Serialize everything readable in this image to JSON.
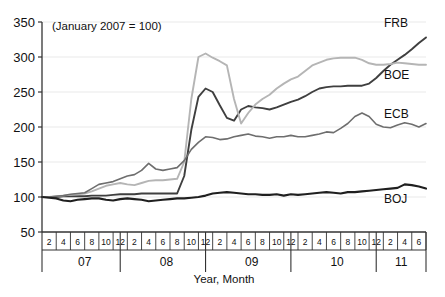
{
  "chart_data": {
    "type": "line",
    "title": "(January 2007 = 100)",
    "xlabel": "Year, Month",
    "ylabel": "",
    "ylim": [
      50,
      350
    ],
    "yticks": [
      50,
      100,
      150,
      200,
      250,
      300,
      350
    ],
    "grid": true,
    "legend_position": "right-inline-labels",
    "years": [
      "07",
      "08",
      "09",
      "10",
      "11"
    ],
    "month_ticks_per_year": {
      "07": [
        2,
        4,
        6,
        8,
        10,
        12
      ],
      "08": [
        2,
        4,
        6,
        8,
        10,
        12
      ],
      "09": [
        2,
        4,
        6,
        8,
        10,
        12
      ],
      "10": [
        2,
        4,
        6,
        8,
        10,
        12
      ],
      "11": [
        2,
        4,
        6
      ]
    },
    "x": [
      "2007-01",
      "2007-02",
      "2007-03",
      "2007-04",
      "2007-05",
      "2007-06",
      "2007-07",
      "2007-08",
      "2007-09",
      "2007-10",
      "2007-11",
      "2007-12",
      "2008-01",
      "2008-02",
      "2008-03",
      "2008-04",
      "2008-05",
      "2008-06",
      "2008-07",
      "2008-08",
      "2008-09",
      "2008-10",
      "2008-11",
      "2008-12",
      "2009-01",
      "2009-02",
      "2009-03",
      "2009-04",
      "2009-05",
      "2009-06",
      "2009-07",
      "2009-08",
      "2009-09",
      "2009-10",
      "2009-11",
      "2009-12",
      "2010-01",
      "2010-02",
      "2010-03",
      "2010-04",
      "2010-05",
      "2010-06",
      "2010-07",
      "2010-08",
      "2010-09",
      "2010-10",
      "2010-11",
      "2010-12",
      "2011-01",
      "2011-02",
      "2011-03",
      "2011-04",
      "2011-05",
      "2011-06",
      "2011-07"
    ],
    "series": [
      {
        "name": "FRB",
        "color": "#3f3f3f",
        "width": 1.9,
        "label_x": "2011-06",
        "values": [
          100,
          100,
          100,
          101,
          101,
          101,
          101,
          102,
          102,
          102,
          103,
          104,
          104,
          104,
          105,
          105,
          105,
          105,
          105,
          105,
          130,
          196,
          243,
          255,
          250,
          231,
          213,
          209,
          225,
          230,
          228,
          227,
          225,
          228,
          232,
          236,
          239,
          244,
          250,
          255,
          257,
          258,
          258,
          259,
          259,
          259,
          262,
          270,
          280,
          289,
          296,
          303,
          311,
          320,
          328
        ]
      },
      {
        "name": "BOE",
        "color": "#b5b5b5",
        "width": 1.9,
        "label_x": "2011-06",
        "values": [
          100,
          100,
          101,
          102,
          103,
          104,
          105,
          108,
          112,
          116,
          118,
          120,
          118,
          117,
          120,
          123,
          124,
          124,
          125,
          126,
          150,
          240,
          300,
          305,
          299,
          294,
          288,
          240,
          205,
          220,
          232,
          240,
          246,
          255,
          262,
          268,
          272,
          280,
          288,
          292,
          296,
          298,
          299,
          299,
          299,
          296,
          291,
          289,
          289,
          290,
          292,
          291,
          290,
          289,
          289
        ]
      },
      {
        "name": "ECB",
        "color": "#6e6e6e",
        "width": 1.6,
        "label_x": "2011-06",
        "values": [
          100,
          100,
          101,
          102,
          104,
          105,
          106,
          112,
          118,
          120,
          122,
          126,
          130,
          132,
          138,
          148,
          140,
          138,
          140,
          142,
          152,
          168,
          178,
          186,
          185,
          182,
          183,
          186,
          188,
          190,
          187,
          186,
          184,
          186,
          186,
          188,
          186,
          186,
          188,
          190,
          193,
          192,
          198,
          205,
          215,
          220,
          215,
          204,
          200,
          199,
          203,
          206,
          204,
          200,
          205
        ]
      },
      {
        "name": "BOJ",
        "color": "#1f1f1f",
        "width": 2.1,
        "label_x": "2011-06",
        "values": [
          100,
          99,
          98,
          95,
          94,
          96,
          97,
          98,
          98,
          96,
          95,
          97,
          98,
          97,
          96,
          94,
          95,
          96,
          97,
          98,
          98,
          99,
          100,
          102,
          105,
          106,
          107,
          106,
          105,
          104,
          104,
          103,
          103,
          104,
          102,
          104,
          103,
          104,
          105,
          106,
          107,
          106,
          105,
          107,
          107,
          108,
          109,
          110,
          111,
          112,
          113,
          118,
          117,
          115,
          112
        ]
      }
    ]
  },
  "styling": {
    "axis_color": "#333333",
    "grid_color": "#e9e9e9",
    "text_color": "#111111",
    "background": "#ffffff"
  }
}
